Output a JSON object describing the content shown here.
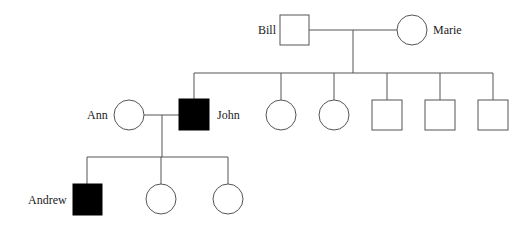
{
  "diagram": {
    "type": "pedigree",
    "colors": {
      "line": "#555555",
      "affected": "#000000",
      "unaffected": "#ffffff"
    },
    "generations": [
      {
        "gen": 1,
        "individuals": [
          {
            "id": "bill",
            "name": "Bill",
            "sex": "male",
            "affected": false
          },
          {
            "id": "marie",
            "name": "Marie",
            "sex": "female",
            "affected": false
          }
        ]
      },
      {
        "gen": 2,
        "individuals": [
          {
            "id": "ann",
            "name": "Ann",
            "sex": "female",
            "affected": false
          },
          {
            "id": "john",
            "name": "John",
            "sex": "male",
            "affected": true
          },
          {
            "id": "c2",
            "name": "",
            "sex": "female",
            "affected": false
          },
          {
            "id": "c3",
            "name": "",
            "sex": "female",
            "affected": false
          },
          {
            "id": "c4",
            "name": "",
            "sex": "male",
            "affected": false
          },
          {
            "id": "c5",
            "name": "",
            "sex": "male",
            "affected": false
          },
          {
            "id": "c6",
            "name": "",
            "sex": "male",
            "affected": false
          }
        ]
      },
      {
        "gen": 3,
        "individuals": [
          {
            "id": "andrew",
            "name": "Andrew",
            "sex": "male",
            "affected": true
          },
          {
            "id": "g2",
            "name": "",
            "sex": "female",
            "affected": false
          },
          {
            "id": "g3",
            "name": "",
            "sex": "female",
            "affected": false
          }
        ]
      }
    ],
    "labels": {
      "bill": "Bill",
      "marie": "Marie",
      "ann": "Ann",
      "john": "John",
      "andrew": "Andrew"
    }
  }
}
